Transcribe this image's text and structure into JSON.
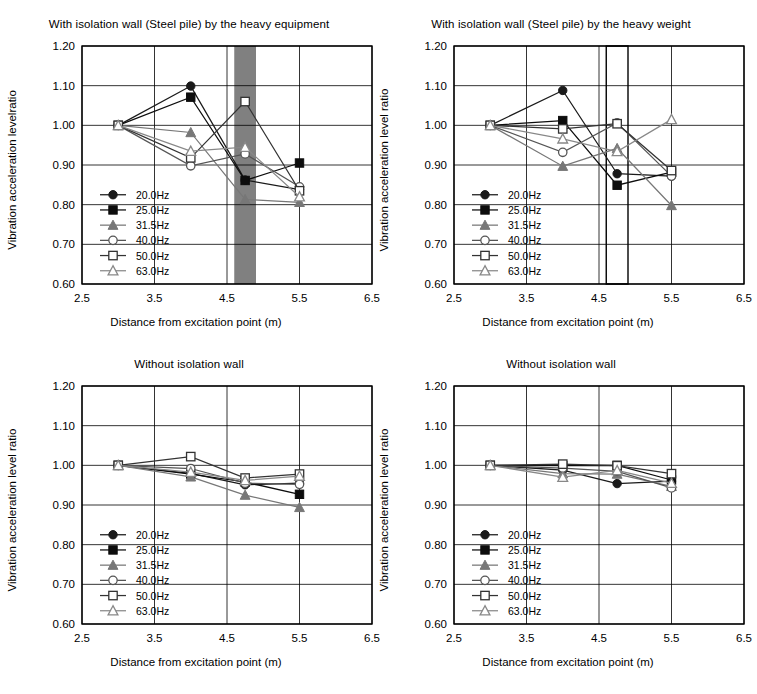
{
  "figure": {
    "width": 757,
    "height": 694,
    "background": "#ffffff"
  },
  "common": {
    "xlabel": "Distance from excitation point (m)",
    "xticks": [
      "2.5",
      "3.5",
      "4.5",
      "5.5",
      "6.5"
    ],
    "yticks": [
      "0.60",
      "0.70",
      "0.80",
      "0.90",
      "1.00",
      "1.10",
      "1.20"
    ],
    "xlim": [
      2.5,
      6.5
    ],
    "ylim": [
      0.6,
      1.2
    ],
    "grid": true,
    "legend_position": "lower-left inside axes",
    "series_names": [
      "20.0Hz",
      "25.0Hz",
      "31.5Hz",
      "40.0Hz",
      "50.0Hz",
      "63.0Hz"
    ],
    "series_markers": [
      "filled-circle",
      "filled-square",
      "filled-triangle",
      "open-circle",
      "open-square",
      "open-triangle"
    ],
    "series_colors": [
      "#1a1a1a",
      "#0d0d0d",
      "#777777",
      "#555555",
      "#333333",
      "#888888"
    ],
    "line_color_dark": "#000000",
    "line_color_gray": "#808080",
    "wall_fill_color": "#808080",
    "wall_stroke_color": "#000000"
  },
  "chart_data": [
    {
      "id": "top-left",
      "type": "line",
      "title": "With isolation wall (Steel pile) by the heavy equipment",
      "xlabel": "Distance from excitation point (m)",
      "ylabel": "Vibration acceleration levelratio",
      "xlim": [
        2.5,
        6.5
      ],
      "ylim": [
        0.6,
        1.2
      ],
      "xticks": [
        2.5,
        3.5,
        4.5,
        5.5,
        6.5
      ],
      "yticks": [
        0.6,
        0.7,
        0.8,
        0.9,
        1.0,
        1.1,
        1.2
      ],
      "grid": true,
      "x": [
        3.0,
        4.0,
        4.75,
        5.5
      ],
      "annotation": {
        "type": "wall-band",
        "fill": "#808080",
        "x_from": 4.6,
        "x_to": 4.9
      },
      "series": [
        {
          "name": "20.0Hz",
          "marker": "filled-circle",
          "color": "#1a1a1a",
          "values": [
            1.0,
            1.099,
            0.862,
            0.838
          ]
        },
        {
          "name": "25.0Hz",
          "marker": "filled-square",
          "color": "#0d0d0d",
          "values": [
            1.0,
            1.071,
            0.861,
            0.905
          ]
        },
        {
          "name": "31.5Hz",
          "marker": "filled-triangle",
          "color": "#777777",
          "values": [
            1.0,
            0.982,
            0.813,
            0.806
          ]
        },
        {
          "name": "40.0Hz",
          "marker": "open-circle",
          "color": "#555555",
          "values": [
            1.0,
            0.898,
            0.928,
            0.845
          ]
        },
        {
          "name": "50.0Hz",
          "marker": "open-square",
          "color": "#333333",
          "values": [
            1.0,
            0.918,
            1.06,
            0.835
          ]
        },
        {
          "name": "63.0Hz",
          "marker": "open-triangle",
          "color": "#888888",
          "values": [
            1.0,
            0.935,
            0.945,
            0.82
          ]
        }
      ]
    },
    {
      "id": "top-right",
      "type": "line",
      "title": "With isolation wall (Steel pile) by the heavy weight",
      "xlabel": "Distance from excitation point (m)",
      "ylabel": "Vibration acceleration level ratio",
      "xlim": [
        2.5,
        6.5
      ],
      "ylim": [
        0.6,
        1.2
      ],
      "xticks": [
        2.5,
        3.5,
        4.5,
        5.5,
        6.5
      ],
      "yticks": [
        0.6,
        0.7,
        0.8,
        0.9,
        1.0,
        1.1,
        1.2
      ],
      "grid": true,
      "x": [
        3.0,
        4.0,
        4.75,
        5.5
      ],
      "annotation": {
        "type": "wall-outline",
        "fill": "#ffffff",
        "stroke": "#000000",
        "x_from": 4.6,
        "x_to": 4.9
      },
      "series": [
        {
          "name": "20.0Hz",
          "marker": "filled-circle",
          "color": "#1a1a1a",
          "values": [
            1.0,
            1.088,
            0.878,
            0.872
          ]
        },
        {
          "name": "25.0Hz",
          "marker": "filled-square",
          "color": "#0d0d0d",
          "values": [
            1.0,
            1.012,
            0.849,
            0.882
          ]
        },
        {
          "name": "31.5Hz",
          "marker": "filled-triangle",
          "color": "#777777",
          "values": [
            1.0,
            0.897,
            0.942,
            0.798
          ]
        },
        {
          "name": "40.0Hz",
          "marker": "open-circle",
          "color": "#555555",
          "values": [
            1.0,
            0.932,
            1.006,
            0.872
          ]
        },
        {
          "name": "50.0Hz",
          "marker": "open-square",
          "color": "#333333",
          "values": [
            1.0,
            0.991,
            1.004,
            0.886
          ]
        },
        {
          "name": "63.0Hz",
          "marker": "open-triangle",
          "color": "#888888",
          "values": [
            1.0,
            0.966,
            0.934,
            1.015
          ]
        }
      ]
    },
    {
      "id": "bottom-left",
      "type": "line",
      "title": "Without isolation wall",
      "xlabel": "Distance from excitation point (m)",
      "ylabel": "Vibration acceleration level ratio",
      "xlim": [
        2.5,
        6.5
      ],
      "ylim": [
        0.6,
        1.2
      ],
      "xticks": [
        2.5,
        3.5,
        4.5,
        5.5,
        6.5
      ],
      "yticks": [
        0.6,
        0.7,
        0.8,
        0.9,
        1.0,
        1.1,
        1.2
      ],
      "grid": true,
      "x": [
        3.0,
        4.0,
        4.75,
        5.5
      ],
      "annotation": null,
      "series": [
        {
          "name": "20.0Hz",
          "marker": "filled-circle",
          "color": "#1a1a1a",
          "values": [
            1.0,
            0.98,
            0.951,
            0.955
          ]
        },
        {
          "name": "25.0Hz",
          "marker": "filled-square",
          "color": "#0d0d0d",
          "values": [
            1.0,
            0.978,
            0.958,
            0.927
          ]
        },
        {
          "name": "31.5Hz",
          "marker": "filled-triangle",
          "color": "#777777",
          "values": [
            1.0,
            0.971,
            0.925,
            0.894
          ]
        },
        {
          "name": "40.0Hz",
          "marker": "open-circle",
          "color": "#555555",
          "values": [
            1.0,
            0.992,
            0.955,
            0.952
          ]
        },
        {
          "name": "50.0Hz",
          "marker": "open-square",
          "color": "#333333",
          "values": [
            1.0,
            1.022,
            0.968,
            0.978
          ]
        },
        {
          "name": "63.0Hz",
          "marker": "open-triangle",
          "color": "#888888",
          "values": [
            1.0,
            0.983,
            0.962,
            0.973
          ]
        }
      ]
    },
    {
      "id": "bottom-right",
      "type": "line",
      "title": "Without isolation wall",
      "xlabel": "Distance from excitation point (m)",
      "ylabel": "Vibration acceleration level ratio",
      "xlim": [
        2.5,
        6.5
      ],
      "ylim": [
        0.6,
        1.2
      ],
      "xticks": [
        2.5,
        3.5,
        4.5,
        5.5,
        6.5
      ],
      "yticks": [
        0.6,
        0.7,
        0.8,
        0.9,
        1.0,
        1.1,
        1.2
      ],
      "grid": true,
      "x": [
        3.0,
        4.0,
        4.75,
        5.5
      ],
      "annotation": null,
      "series": [
        {
          "name": "20.0Hz",
          "marker": "filled-circle",
          "color": "#1a1a1a",
          "values": [
            1.0,
            0.988,
            0.954,
            0.96
          ]
        },
        {
          "name": "25.0Hz",
          "marker": "filled-square",
          "color": "#0d0d0d",
          "values": [
            1.0,
            0.999,
            1.0,
            0.963
          ]
        },
        {
          "name": "31.5Hz",
          "marker": "filled-triangle",
          "color": "#777777",
          "values": [
            1.0,
            0.979,
            0.978,
            0.947
          ]
        },
        {
          "name": "40.0Hz",
          "marker": "open-circle",
          "color": "#555555",
          "values": [
            1.0,
            0.993,
            0.985,
            0.943
          ]
        },
        {
          "name": "50.0Hz",
          "marker": "open-square",
          "color": "#333333",
          "values": [
            1.0,
            1.003,
            0.999,
            0.979
          ]
        },
        {
          "name": "63.0Hz",
          "marker": "open-triangle",
          "color": "#888888",
          "values": [
            1.0,
            0.97,
            0.987,
            0.955
          ]
        }
      ]
    }
  ]
}
